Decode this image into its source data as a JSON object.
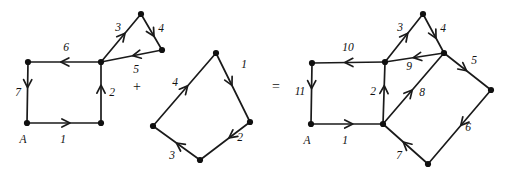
{
  "figure": {
    "caption": "",
    "background_color": "#ffffff",
    "ink_color": "#111111",
    "operators": [
      {
        "name": "plus-operator",
        "symbol": "+",
        "x": 137,
        "y": 88
      },
      {
        "name": "equals-operator",
        "symbol": "=",
        "x": 276,
        "y": 88
      }
    ],
    "graphs": [
      {
        "id": "left-graph",
        "name": "first-addend-graph",
        "vertices": [
          {
            "id": "L_A",
            "x": 27,
            "y": 123,
            "label": "A",
            "label_x": 23,
            "label_y": 140
          },
          {
            "id": "L_TL",
            "x": 28,
            "y": 62,
            "label": "",
            "label_x": 0,
            "label_y": 0
          },
          {
            "id": "L_C",
            "x": 101,
            "y": 62,
            "label": "",
            "label_x": 0,
            "label_y": 0
          },
          {
            "id": "L_BR",
            "x": 101,
            "y": 123,
            "label": "",
            "label_x": 0,
            "label_y": 0
          },
          {
            "id": "L_TP",
            "x": 141,
            "y": 14,
            "label": "",
            "label_x": 0,
            "label_y": 0
          },
          {
            "id": "L_TR",
            "x": 162,
            "y": 50,
            "label": "",
            "label_x": 0,
            "label_y": 0
          }
        ],
        "edges": [
          {
            "id": "L1",
            "from": "L_A",
            "to": "L_BR",
            "label": "1",
            "label_x": 63,
            "label_y": 140,
            "arrow_t": 0.58
          },
          {
            "id": "L2",
            "from": "L_BR",
            "to": "L_C",
            "label": "2",
            "label_x": 112,
            "label_y": 93,
            "arrow_t": 0.62
          },
          {
            "id": "L3",
            "from": "L_C",
            "to": "L_TP",
            "label": "3",
            "label_x": 118,
            "label_y": 28,
            "arrow_t": 0.6
          },
          {
            "id": "L4",
            "from": "L_TP",
            "to": "L_TR",
            "label": "4",
            "label_x": 161,
            "label_y": 29,
            "arrow_t": 0.62
          },
          {
            "id": "L5",
            "from": "L_TR",
            "to": "L_C",
            "label": "5",
            "label_x": 136,
            "label_y": 70,
            "arrow_t": 0.48
          },
          {
            "id": "L6",
            "from": "L_C",
            "to": "L_TL",
            "label": "6",
            "label_x": 66,
            "label_y": 48,
            "arrow_t": 0.55
          },
          {
            "id": "L7",
            "from": "L_TL",
            "to": "L_A",
            "label": "7",
            "label_x": 18,
            "label_y": 93,
            "arrow_t": 0.42
          }
        ]
      },
      {
        "id": "middle-graph",
        "name": "second-addend-graph",
        "vertices": [
          {
            "id": "M_T",
            "x": 216,
            "y": 53,
            "label": "",
            "label_x": 0,
            "label_y": 0
          },
          {
            "id": "M_R",
            "x": 250,
            "y": 122,
            "label": "",
            "label_x": 0,
            "label_y": 0
          },
          {
            "id": "M_B",
            "x": 200,
            "y": 160,
            "label": "",
            "label_x": 0,
            "label_y": 0
          },
          {
            "id": "M_L",
            "x": 153,
            "y": 126,
            "label": "",
            "label_x": 0,
            "label_y": 0
          }
        ],
        "edges": [
          {
            "id": "M1",
            "from": "M_T",
            "to": "M_R",
            "label": "1",
            "label_x": 244,
            "label_y": 65,
            "arrow_t": 0.47
          },
          {
            "id": "M2",
            "from": "M_R",
            "to": "M_B",
            "label": "2",
            "label_x": 240,
            "label_y": 138,
            "arrow_t": 0.42
          },
          {
            "id": "M3",
            "from": "M_B",
            "to": "M_L",
            "label": "3",
            "label_x": 172,
            "label_y": 156,
            "arrow_t": 0.5
          },
          {
            "id": "M4",
            "from": "M_L",
            "to": "M_T",
            "label": "4",
            "label_x": 175,
            "label_y": 83,
            "arrow_t": 0.55
          }
        ]
      },
      {
        "id": "right-graph",
        "name": "sum-graph",
        "vertices": [
          {
            "id": "R_A",
            "x": 311,
            "y": 124,
            "label": "A",
            "label_x": 307,
            "label_y": 141
          },
          {
            "id": "R_TL",
            "x": 312,
            "y": 63,
            "label": "",
            "label_x": 0,
            "label_y": 0
          },
          {
            "id": "R_C",
            "x": 385,
            "y": 62,
            "label": "",
            "label_x": 0,
            "label_y": 0
          },
          {
            "id": "R_BC",
            "x": 383,
            "y": 124,
            "label": "",
            "label_x": 0,
            "label_y": 0
          },
          {
            "id": "R_TP",
            "x": 423,
            "y": 14,
            "label": "",
            "label_x": 0,
            "label_y": 0
          },
          {
            "id": "R_TR",
            "x": 444,
            "y": 53,
            "label": "",
            "label_x": 0,
            "label_y": 0
          },
          {
            "id": "R_RR",
            "x": 491,
            "y": 90,
            "label": "",
            "label_x": 0,
            "label_y": 0
          },
          {
            "id": "R_BB",
            "x": 428,
            "y": 164,
            "label": "",
            "label_x": 0,
            "label_y": 0
          }
        ],
        "edges": [
          {
            "id": "R1",
            "from": "R_A",
            "to": "R_BC",
            "label": "1",
            "label_x": 345,
            "label_y": 141,
            "arrow_t": 0.58
          },
          {
            "id": "R2",
            "from": "R_BC",
            "to": "R_C",
            "label": "2",
            "label_x": 373,
            "label_y": 92,
            "arrow_t": 0.62
          },
          {
            "id": "R3",
            "from": "R_C",
            "to": "R_TP",
            "label": "3",
            "label_x": 400,
            "label_y": 28,
            "arrow_t": 0.6
          },
          {
            "id": "R4",
            "from": "R_TP",
            "to": "R_TR",
            "label": "4",
            "label_x": 443,
            "label_y": 29,
            "arrow_t": 0.62
          },
          {
            "id": "R5",
            "from": "R_TR",
            "to": "R_RR",
            "label": "5",
            "label_x": 474,
            "label_y": 61,
            "arrow_t": 0.48
          },
          {
            "id": "R6",
            "from": "R_RR",
            "to": "R_BB",
            "label": "6",
            "label_x": 468,
            "label_y": 128,
            "arrow_t": 0.48
          },
          {
            "id": "R7",
            "from": "R_BB",
            "to": "R_BC",
            "label": "7",
            "label_x": 399,
            "label_y": 156,
            "arrow_t": 0.55
          },
          {
            "id": "R8",
            "from": "R_BC",
            "to": "R_TR",
            "label": "8",
            "label_x": 422,
            "label_y": 93,
            "arrow_t": 0.48
          },
          {
            "id": "R9",
            "from": "R_TR",
            "to": "R_C",
            "label": "9",
            "label_x": 409,
            "label_y": 67,
            "arrow_t": 0.52
          },
          {
            "id": "R10",
            "from": "R_C",
            "to": "R_TL",
            "label": "10",
            "label_x": 348,
            "label_y": 48,
            "arrow_t": 0.55
          },
          {
            "id": "R11",
            "from": "R_TL",
            "to": "R_A",
            "label": "11",
            "label_x": 300,
            "label_y": 92,
            "arrow_t": 0.42
          }
        ]
      }
    ]
  }
}
